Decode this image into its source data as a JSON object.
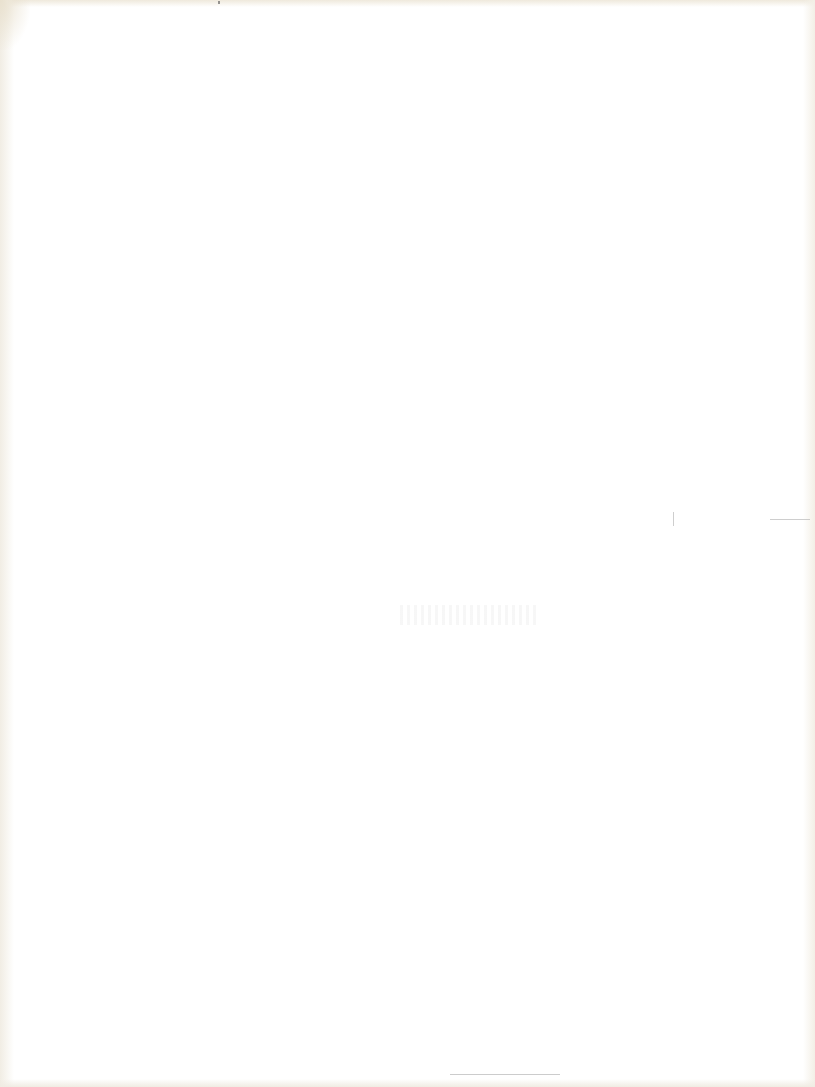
{
  "document": {
    "type": "scanned-page",
    "content": "",
    "paper_color": "#ffffff",
    "edge_color": "#f1ede4",
    "text_blocks": []
  }
}
